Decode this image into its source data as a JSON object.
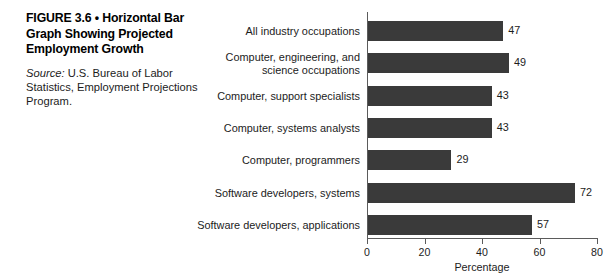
{
  "caption": {
    "title": "FIGURE 3.6 • Horizontal Bar Graph Showing Projected Employment Growth",
    "source_label": "Source:",
    "source_text": " U.S. Bureau of Labor Statistics, Employment Projections Program."
  },
  "colors": {
    "bar": "#3a3a3a",
    "axis": "#5b5b5b",
    "text": "#1c1c1c",
    "background": "#ffffff"
  },
  "chart_data": {
    "type": "bar",
    "orientation": "horizontal",
    "title": "",
    "xlabel": "Percentage",
    "ylabel": "",
    "xlim": [
      0,
      80
    ],
    "xticks": [
      0,
      20,
      40,
      60,
      80
    ],
    "grid": false,
    "legend": false,
    "categories": [
      "All industry occupations",
      "Computer, engineering, and\nscience occupations",
      "Computer, support specialists",
      "Computer, systems analysts",
      "Computer, programmers",
      "Software developers, systems",
      "Software developers, applications"
    ],
    "values": [
      47,
      49,
      43,
      43,
      29,
      72,
      57
    ],
    "data_labels": [
      "47",
      "49",
      "43",
      "43",
      "29",
      "72",
      "57"
    ],
    "tick_labels": [
      "0",
      "20",
      "40",
      "60",
      "80"
    ]
  }
}
